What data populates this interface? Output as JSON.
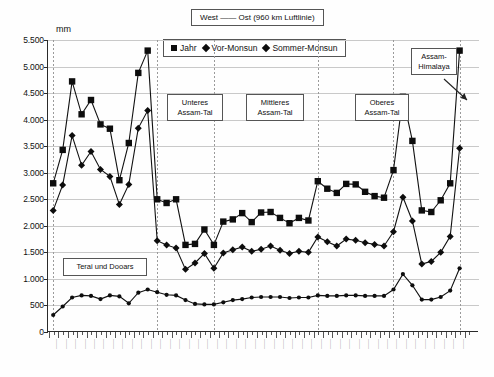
{
  "figure": {
    "title": "West —— Ost (960 km Luftlinie)",
    "y_axis_unit": "mm"
  },
  "legend": {
    "position": "top-center",
    "items": [
      {
        "label": "Jahr",
        "marker": "square"
      },
      {
        "label": "Vor-Monsun",
        "marker": "diamond"
      },
      {
        "label": "Sommer-Monsun",
        "marker": "diamond"
      }
    ]
  },
  "annotations": [
    {
      "name": "terai-und-dooars",
      "text": "Terai und Dooars"
    },
    {
      "name": "unteres-assam-tal",
      "text": "Unteres\nAssam-Tal"
    },
    {
      "name": "mittleres-assam-tal",
      "text": "Mittleres\nAssam-Tal"
    },
    {
      "name": "oberes-assam-tal",
      "text": "Oberes\nAssam-Tal"
    },
    {
      "name": "assam-himalaya",
      "text": "Assam-\nHimalaya"
    }
  ],
  "chart_data": {
    "type": "line",
    "title": "West —— Ost (960 km Luftlinie)",
    "xlabel": "",
    "ylabel": "mm",
    "ylim": [
      0,
      5500
    ],
    "ytick_step": 500,
    "ytick_labels": [
      "0",
      "500",
      "1.000",
      "1.500",
      "2.000",
      "2.500",
      "3.000",
      "3.500",
      "4.000",
      "4.500",
      "5.000",
      "5.500"
    ],
    "grid": true,
    "legend_position": "top-center",
    "n_stations": 54,
    "series": [
      {
        "name": "Jahr",
        "marker": "square",
        "values": [
          2800,
          3430,
          4720,
          4100,
          4370,
          3910,
          3830,
          2860,
          3560,
          4880,
          5300,
          2500,
          2430,
          2500,
          1640,
          1660,
          1930,
          1640,
          2080,
          2120,
          2240,
          2070,
          2250,
          2260,
          2150,
          2050,
          2150,
          2100,
          2840,
          2700,
          2620,
          2790,
          2780,
          2640,
          2560,
          2530,
          3050,
          4430,
          3600,
          2290,
          2260,
          2480,
          2800,
          5300
        ]
      },
      {
        "name": "Vor-Monsun",
        "marker": "diamond",
        "values": [
          2290,
          2770,
          3700,
          3140,
          3400,
          3060,
          2930,
          2400,
          2780,
          3840,
          4170,
          1720,
          1640,
          1580,
          1180,
          1300,
          1480,
          1200,
          1490,
          1550,
          1600,
          1520,
          1560,
          1620,
          1540,
          1480,
          1520,
          1500,
          1790,
          1700,
          1620,
          1750,
          1730,
          1680,
          1650,
          1620,
          1890,
          2540,
          2090,
          1280,
          1330,
          1500,
          1800,
          3460
        ]
      },
      {
        "name": "Sommer-Monsun",
        "marker": "dot",
        "values": [
          320,
          480,
          650,
          690,
          680,
          620,
          690,
          670,
          540,
          740,
          800,
          750,
          700,
          690,
          600,
          530,
          520,
          520,
          560,
          600,
          620,
          650,
          660,
          660,
          660,
          640,
          650,
          650,
          690,
          680,
          680,
          690,
          690,
          680,
          680,
          680,
          800,
          1090,
          880,
          610,
          610,
          660,
          780,
          1200
        ]
      }
    ]
  }
}
